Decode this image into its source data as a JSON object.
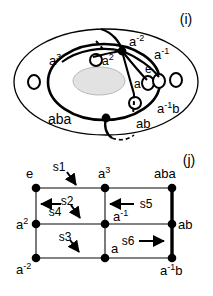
{
  "figure": {
    "panels": [
      {
        "id": "i",
        "tag": "(i)",
        "type": "annulus-torus-diagram",
        "labels": [
          {
            "name": "a-cubed",
            "text": "a3",
            "base": "a",
            "exp": "3"
          },
          {
            "name": "a-minus-two",
            "text": "a-2",
            "base": "a",
            "exp": "-2"
          },
          {
            "name": "a-minus-one",
            "text": "a-1",
            "base": "a",
            "exp": "-1"
          },
          {
            "name": "a-squared",
            "text": "a2",
            "base": "a",
            "exp": "2"
          },
          {
            "name": "identity-e",
            "text": "e",
            "base": "e",
            "exp": ""
          },
          {
            "name": "a-element",
            "text": "a",
            "base": "a",
            "exp": ""
          },
          {
            "name": "a-minus-one-b",
            "text": "a-1b",
            "base": "a",
            "exp": "-1",
            "suffix": "b"
          },
          {
            "name": "aba-element",
            "text": "aba",
            "base": "aba",
            "exp": ""
          },
          {
            "name": "ab-element",
            "text": "ab",
            "base": "ab",
            "exp": ""
          }
        ]
      },
      {
        "id": "j",
        "tag": "(j)",
        "type": "cayley-grid",
        "vertices": [
          {
            "name": "vertex-e",
            "base": "e",
            "exp": "",
            "suffix": "",
            "col": 0,
            "row": 0,
            "label_pos": "above-left"
          },
          {
            "name": "vertex-a3",
            "base": "a",
            "exp": "3",
            "suffix": "",
            "col": 1,
            "row": 0,
            "label_pos": "above"
          },
          {
            "name": "vertex-aba",
            "base": "aba",
            "exp": "",
            "suffix": "",
            "col": 2,
            "row": 0,
            "label_pos": "above"
          },
          {
            "name": "vertex-a2",
            "base": "a",
            "exp": "2",
            "suffix": "",
            "col": 0,
            "row": 1,
            "label_pos": "left"
          },
          {
            "name": "vertex-a-inv",
            "base": "a",
            "exp": "-1",
            "suffix": "",
            "col": 1,
            "row": 1,
            "label_pos": "right-below"
          },
          {
            "name": "vertex-ab",
            "base": "ab",
            "exp": "",
            "suffix": "",
            "col": 2,
            "row": 1,
            "label_pos": "right"
          },
          {
            "name": "vertex-a-minus2",
            "base": "a",
            "exp": "-2",
            "suffix": "",
            "col": 0,
            "row": 2,
            "label_pos": "below-left"
          },
          {
            "name": "vertex-a",
            "base": "a",
            "exp": "",
            "suffix": "",
            "col": 1,
            "row": 2,
            "label_pos": "above-right"
          },
          {
            "name": "vertex-a-inv-b",
            "base": "a",
            "exp": "-1",
            "suffix": "b",
            "col": 2,
            "row": 2,
            "label_pos": "below-right"
          }
        ],
        "arrows": [
          {
            "name": "arrow-s1",
            "label": "s1",
            "direction": "down-right"
          },
          {
            "name": "arrow-s2",
            "label": "s2",
            "direction": "down-right"
          },
          {
            "name": "arrow-s3",
            "label": "s3",
            "direction": "down-right"
          },
          {
            "name": "arrow-s4",
            "label": "s4",
            "direction": "left"
          },
          {
            "name": "arrow-s5",
            "label": "s5",
            "direction": "left"
          },
          {
            "name": "arrow-s6",
            "label": "s6",
            "direction": "right"
          }
        ]
      }
    ],
    "colors": {
      "ink": "#000000",
      "grid_line": "#5a5a5a",
      "hole_fill": "#e2e2e2",
      "background": "#ffffff"
    }
  }
}
